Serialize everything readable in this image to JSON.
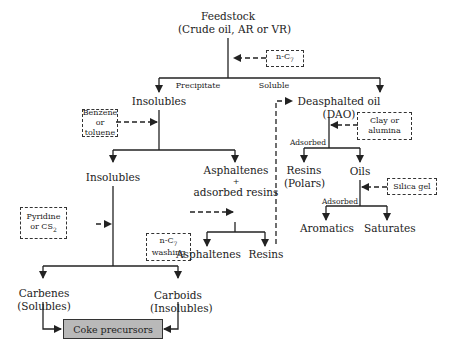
{
  "diagram": {
    "type": "flowchart",
    "colors": {
      "line": "#222222",
      "coke_box_fill": "#b9b9b9",
      "background": "#ffffff"
    },
    "nodes": {
      "feedstock": {
        "line1": "Feedstock",
        "line2": "(Crude oil, AR or VR)"
      },
      "insolubles_1": {
        "label": "Insolubles"
      },
      "dao": {
        "line1": "Deasphalted oil",
        "line2": "(DAO)"
      },
      "insolubles_2": {
        "label": "Insolubles"
      },
      "asphaltenes_resins": {
        "line1": "Asphaltenes",
        "line2": "+",
        "line3": "adsorbed resins"
      },
      "asphaltenes": {
        "label": "Asphaltenes"
      },
      "resins_washed": {
        "label": "Resins"
      },
      "resins_polars": {
        "line1": "Resins",
        "line2": "(Polars)"
      },
      "oils": {
        "label": "Oils"
      },
      "aromatics": {
        "label": "Aromatics"
      },
      "saturates": {
        "label": "Saturates"
      },
      "carbenes": {
        "line1": "Carbenes",
        "line2": "(Solubles)"
      },
      "carboids": {
        "line1": "Carboids",
        "line2": "(Insolubles)"
      },
      "coke_precursors": {
        "label": "Coke precursors"
      }
    },
    "solvents": {
      "n_c7": {
        "text": "n-C",
        "sub": "7"
      },
      "benzene": {
        "line1": "Benzene",
        "line2": "or toluene"
      },
      "clay": {
        "line1": "Clay or",
        "line2": "alumina"
      },
      "pyridine": {
        "line1": "Pyridine",
        "line2": "or CS",
        "sub": "2"
      },
      "n_c7_washing": {
        "line1": "n-C",
        "sub": "7",
        "line2": "washing"
      },
      "silica": {
        "label": "Silica gel"
      }
    },
    "edge_labels": {
      "precipitate": "Precipitate",
      "soluble": "Soluble",
      "adsorbed_dao": "Adsorbed",
      "adsorbed_oils": "Adsorbed"
    }
  }
}
